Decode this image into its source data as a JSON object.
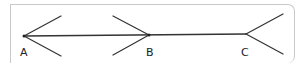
{
  "diagram": {
    "type": "geometry-line-with-rays",
    "colors": {
      "line": "#333333",
      "frame": "#c9c9c9",
      "label": "#222222",
      "background": "#ffffff"
    },
    "main_line": {
      "from": [
        24,
        36
      ],
      "to": [
        246,
        34
      ]
    },
    "points": [
      {
        "id": "A",
        "label": "A",
        "vertex": [
          24,
          36
        ],
        "label_pos": [
          20,
          47
        ],
        "rays": [
          {
            "to": [
              61,
              16
            ]
          },
          {
            "to": [
              61,
              56
            ]
          }
        ]
      },
      {
        "id": "B",
        "label": "B",
        "vertex": [
          149,
          35
        ],
        "label_pos": [
          146,
          47
        ],
        "rays": [
          {
            "to": [
              113,
              16
            ]
          },
          {
            "to": [
              113,
              55
            ]
          }
        ]
      },
      {
        "id": "C",
        "label": "C",
        "vertex": [
          246,
          34
        ],
        "label_pos": [
          241,
          47
        ],
        "rays": [
          {
            "to": [
              283,
              14
            ]
          },
          {
            "to": [
              283,
              54
            ]
          }
        ]
      }
    ]
  }
}
